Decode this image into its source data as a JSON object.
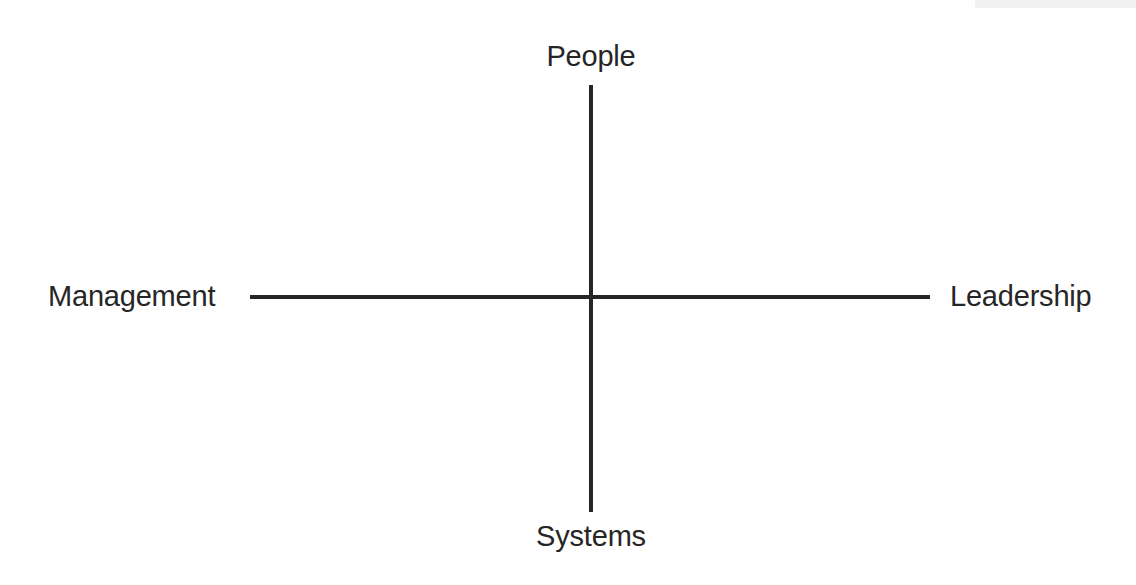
{
  "diagram": {
    "background_color": "#ffffff",
    "line_color": "#262626",
    "text_color": "#262626",
    "axes": {
      "vertical": {
        "top_label": "People",
        "bottom_label": "Systems"
      },
      "horizontal": {
        "left_label": "Management",
        "right_label": "Leadership"
      }
    }
  },
  "chart_data": {
    "type": "scatter",
    "title": "",
    "subtitle": "",
    "xlabel": "",
    "ylabel": "",
    "grid": false,
    "legend": null,
    "series": [],
    "annotations": [
      {
        "text": "People",
        "position": "top",
        "axis": "y-positive"
      },
      {
        "text": "Systems",
        "position": "bottom",
        "axis": "y-negative"
      },
      {
        "text": "Management",
        "position": "left",
        "axis": "x-negative"
      },
      {
        "text": "Leadership",
        "position": "right",
        "axis": "x-positive"
      }
    ],
    "axis_cross_point": [
      591,
      297
    ],
    "x_axis_extent_px": [
      250,
      930
    ],
    "y_axis_extent_px": [
      85,
      512
    ],
    "xlim": [
      "Management",
      "Leadership"
    ],
    "ylim": [
      "Systems",
      "People"
    ]
  }
}
